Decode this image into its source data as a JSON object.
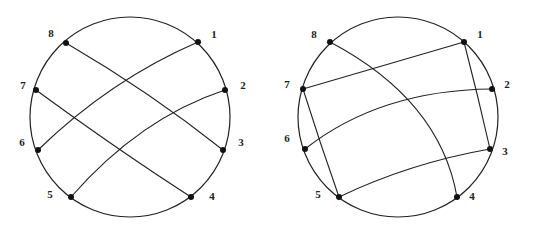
{
  "figures": [
    {
      "id": "left",
      "description": "Circle with 8 boundary points; chords 8-3, 7-4, 6-1, 5-2",
      "circle": {
        "cx": 130,
        "cy": 117,
        "r": 100
      },
      "points": [
        {
          "label": "1",
          "x": 198,
          "y": 42,
          "lx": 214,
          "ly": 38
        },
        {
          "label": "2",
          "x": 225,
          "y": 90,
          "lx": 243,
          "ly": 89
        },
        {
          "label": "3",
          "x": 223,
          "y": 150,
          "lx": 241,
          "ly": 146
        },
        {
          "label": "4",
          "x": 191,
          "y": 197,
          "lx": 212,
          "ly": 200
        },
        {
          "label": "5",
          "x": 71,
          "y": 197,
          "lx": 50,
          "ly": 198
        },
        {
          "label": "6",
          "x": 38,
          "y": 150,
          "lx": 22,
          "ly": 146
        },
        {
          "label": "7",
          "x": 36,
          "y": 90,
          "lx": 23,
          "ly": 89
        },
        {
          "label": "8",
          "x": 66,
          "y": 43,
          "lx": 51,
          "ly": 37
        }
      ],
      "chords": [
        {
          "from": "8",
          "to": "3",
          "path": "M66,43 Q150,92 223,150"
        },
        {
          "from": "7",
          "to": "4",
          "path": "M36,90 Q118,150 191,197"
        },
        {
          "from": "6",
          "to": "1",
          "path": "M38,150 Q110,80 198,42"
        },
        {
          "from": "5",
          "to": "2",
          "path": "M71,197 Q140,118 225,90"
        }
      ]
    },
    {
      "id": "right",
      "description": "Circle with 8 boundary points; chords 8-4, 7-1, 7-5, 6-2, 1-3, 5-3",
      "circle": {
        "cx": 398,
        "cy": 117,
        "r": 100
      },
      "points": [
        {
          "label": "1",
          "x": 464,
          "y": 42,
          "lx": 480,
          "ly": 38
        },
        {
          "label": "2",
          "x": 492,
          "y": 89,
          "lx": 507,
          "ly": 88
        },
        {
          "label": "3",
          "x": 490,
          "y": 149,
          "lx": 505,
          "ly": 155
        },
        {
          "label": "4",
          "x": 457,
          "y": 197,
          "lx": 472,
          "ly": 200
        },
        {
          "label": "5",
          "x": 339,
          "y": 197,
          "lx": 318,
          "ly": 198
        },
        {
          "label": "6",
          "x": 305,
          "y": 149,
          "lx": 287,
          "ly": 142
        },
        {
          "label": "7",
          "x": 303,
          "y": 89,
          "lx": 287,
          "ly": 88
        },
        {
          "label": "8",
          "x": 330,
          "y": 42,
          "lx": 314,
          "ly": 38
        }
      ],
      "chords": [
        {
          "from": "8",
          "to": "4",
          "path": "M330,42 Q440,100 457,197"
        },
        {
          "from": "7",
          "to": "1",
          "path": "M303,89 Q383,66 464,42"
        },
        {
          "from": "7",
          "to": "5",
          "path": "M303,89 Q320,143 339,197"
        },
        {
          "from": "6",
          "to": "2",
          "path": "M305,149 Q380,90 492,89"
        },
        {
          "from": "1",
          "to": "3",
          "path": "M464,42 Q478,96 490,149"
        },
        {
          "from": "5",
          "to": "3",
          "path": "M339,197 Q410,163 490,149"
        }
      ]
    }
  ],
  "colors": {
    "stroke": "#222222",
    "point": "#111111",
    "background": "#ffffff"
  }
}
